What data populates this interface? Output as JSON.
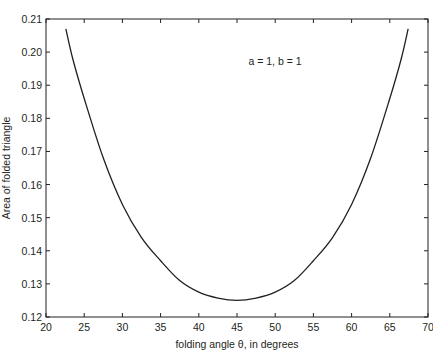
{
  "chart_data": {
    "type": "line",
    "title": "",
    "xlabel": "folding angle θ, in degrees",
    "ylabel": "Area of  folded triangle",
    "xlim": [
      20,
      70
    ],
    "ylim": [
      0.12,
      0.21
    ],
    "xticks": [
      20,
      25,
      30,
      35,
      40,
      45,
      50,
      55,
      60,
      65,
      70
    ],
    "yticks": [
      0.12,
      0.13,
      0.14,
      0.15,
      0.16,
      0.17,
      0.18,
      0.19,
      0.2,
      0.21
    ],
    "ytick_labels": [
      "0.12",
      "0.13",
      "0.14",
      "0.15",
      "0.16",
      "0.17",
      "0.18",
      "0.19",
      "0.20",
      "0.21"
    ],
    "grid": false,
    "legend": null,
    "annotations": [
      {
        "text": "a = 1, b = 1",
        "x": 45,
        "y": 0.196
      }
    ],
    "series": [
      {
        "name": "area",
        "color": "#231f20",
        "x": [
          22.6,
          23.5,
          25,
          27.5,
          30,
          32.5,
          35,
          37.5,
          40,
          42.5,
          45,
          47.5,
          50,
          52.5,
          55,
          57.5,
          60,
          62.5,
          65,
          66.5,
          67.4
        ],
        "y": [
          0.207,
          0.198,
          0.186,
          0.168,
          0.154,
          0.144,
          0.137,
          0.131,
          0.1275,
          0.1257,
          0.125,
          0.1257,
          0.1275,
          0.131,
          0.137,
          0.144,
          0.154,
          0.168,
          0.186,
          0.198,
          0.207
        ]
      }
    ]
  }
}
